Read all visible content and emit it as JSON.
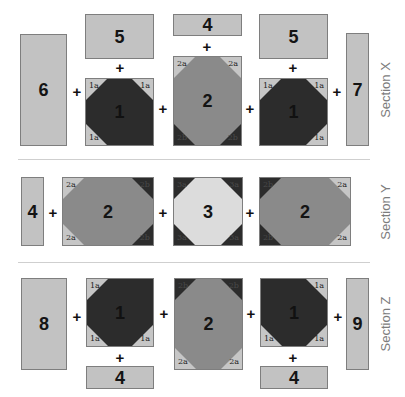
{
  "colors": {
    "light": "#c2c2c2",
    "medium": "#8a8a8a",
    "dark": "#2c2c2c",
    "pale": "#dcdcdc",
    "label": "#7c7c7c"
  },
  "plus": "+",
  "sections": {
    "x": {
      "label": "Section X",
      "blocks": {
        "b6": {
          "label": "6"
        },
        "b5_left": {
          "label": "5"
        },
        "b1_left": {
          "label": "1",
          "corners": {
            "tl": "1a",
            "tr": "1a",
            "bl": "1a"
          }
        },
        "b4_top": {
          "label": "4"
        },
        "b2": {
          "label": "2",
          "corners": {
            "tl": "2a",
            "tr": "2a",
            "bl": "2b",
            "br": "2b"
          }
        },
        "b5_right": {
          "label": "5"
        },
        "b1_right": {
          "label": "1",
          "corners": {
            "tl": "1a",
            "tr": "1a",
            "br": "1a"
          }
        },
        "b7": {
          "label": "7"
        }
      }
    },
    "y": {
      "label": "Section Y",
      "blocks": {
        "b4": {
          "label": "4"
        },
        "b2_left": {
          "label": "2",
          "corners": {
            "tl": "2a",
            "tr": "2b",
            "bl": "2a",
            "br": "2b"
          }
        },
        "b3": {
          "label": "3",
          "corners": {
            "tl": "3a",
            "tr": "3a",
            "bl": "3a",
            "br": "3a"
          }
        },
        "b2_right": {
          "label": "2",
          "corners": {
            "tl": "2b",
            "tr": "2a",
            "bl": "2b",
            "br": "2a"
          }
        }
      }
    },
    "z": {
      "label": "Section Z",
      "blocks": {
        "b8": {
          "label": "8"
        },
        "b1_left": {
          "label": "1",
          "corners": {
            "tl": "1a",
            "bl": "1a",
            "br": "1a"
          }
        },
        "b4_left": {
          "label": "4"
        },
        "b2": {
          "label": "2",
          "corners": {
            "tl": "2b",
            "tr": "2b",
            "bl": "2a",
            "br": "2a"
          }
        },
        "b1_right": {
          "label": "1",
          "corners": {
            "tr": "1a",
            "bl": "1a",
            "br": "1a"
          }
        },
        "b4_right": {
          "label": "4"
        },
        "b9": {
          "label": "9"
        }
      }
    }
  }
}
